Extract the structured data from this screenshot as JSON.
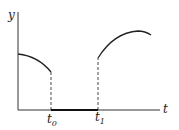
{
  "diagram": {
    "type": "piecewise-function-graph",
    "axes": {
      "y_label": "y",
      "x_label": "t"
    },
    "ticks": [
      {
        "base": "t",
        "sub": "0"
      },
      {
        "base": "t",
        "sub": "1"
      }
    ],
    "segments": [
      {
        "name": "left-curve",
        "description": "decreasing curve from y-axis to t0"
      },
      {
        "name": "zero-segment",
        "description": "function equals zero between t0 and t1"
      },
      {
        "name": "right-curve",
        "description": "rising curve from t1 to a peak then slightly decreasing"
      }
    ],
    "colors": {
      "stroke": "#222222",
      "background": "#ffffff"
    }
  }
}
